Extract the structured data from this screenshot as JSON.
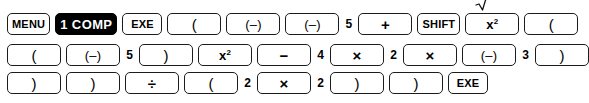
{
  "diagram": {
    "type": "key-sequence",
    "colors": {
      "background": "#ffffff",
      "key_outline": "#1c1c1c",
      "key_fill": "#ffffff",
      "key_text": "#000000",
      "inverted_fill": "#000000",
      "inverted_text": "#ffffff"
    },
    "rows": [
      {
        "index": 1,
        "items": [
          {
            "kind": "key",
            "name": "key-menu",
            "style": "label",
            "label": "MENU"
          },
          {
            "kind": "key",
            "name": "key-1-comp",
            "style": "inverted",
            "label": "1 COMP"
          },
          {
            "kind": "key",
            "name": "key-exe",
            "style": "label",
            "label": "EXE"
          },
          {
            "kind": "key",
            "name": "key-open-paren",
            "style": "paren",
            "label": "("
          },
          {
            "kind": "key",
            "name": "key-negative",
            "style": "neg",
            "label": "(–)"
          },
          {
            "kind": "key",
            "name": "key-negative",
            "style": "neg",
            "label": "(–)"
          },
          {
            "kind": "digit",
            "name": "digit-5",
            "style": "digit",
            "label": "5"
          },
          {
            "kind": "key",
            "name": "key-plus",
            "style": "op",
            "label": "+"
          },
          {
            "kind": "key",
            "name": "key-shift",
            "style": "label",
            "label": "SHIFT"
          },
          {
            "kind": "key",
            "name": "key-x-squared",
            "style": "sq",
            "label": "x²",
            "shift_mark": "sqrt-icon"
          },
          {
            "kind": "key",
            "name": "key-open-paren",
            "style": "paren",
            "label": "("
          }
        ]
      },
      {
        "index": 2,
        "items": [
          {
            "kind": "key",
            "name": "key-open-paren",
            "style": "paren",
            "label": "("
          },
          {
            "kind": "key",
            "name": "key-negative",
            "style": "neg",
            "label": "(–)"
          },
          {
            "kind": "digit",
            "name": "digit-5",
            "style": "digit",
            "label": "5"
          },
          {
            "kind": "key",
            "name": "key-close-paren",
            "style": "paren",
            "label": ")"
          },
          {
            "kind": "key",
            "name": "key-x-squared",
            "style": "sq",
            "label": "x²"
          },
          {
            "kind": "key",
            "name": "key-minus",
            "style": "op",
            "label": "−"
          },
          {
            "kind": "digit",
            "name": "digit-4",
            "style": "digit",
            "label": "4"
          },
          {
            "kind": "key",
            "name": "key-multiply",
            "style": "op",
            "label": "×"
          },
          {
            "kind": "digit",
            "name": "digit-2",
            "style": "digit",
            "label": "2"
          },
          {
            "kind": "key",
            "name": "key-multiply",
            "style": "op",
            "label": "×"
          },
          {
            "kind": "key",
            "name": "key-negative",
            "style": "neg",
            "label": "(–)"
          },
          {
            "kind": "digit",
            "name": "digit-3",
            "style": "digit",
            "label": "3"
          },
          {
            "kind": "key",
            "name": "key-close-paren",
            "style": "paren",
            "label": ")"
          }
        ]
      },
      {
        "index": 3,
        "items": [
          {
            "kind": "key",
            "name": "key-close-paren",
            "style": "paren",
            "label": ")"
          },
          {
            "kind": "key",
            "name": "key-close-paren",
            "style": "paren",
            "label": ")"
          },
          {
            "kind": "key",
            "name": "key-divide",
            "style": "op",
            "label": "÷"
          },
          {
            "kind": "key",
            "name": "key-open-paren",
            "style": "paren",
            "label": "("
          },
          {
            "kind": "digit",
            "name": "digit-2",
            "style": "digit",
            "label": "2"
          },
          {
            "kind": "key",
            "name": "key-multiply",
            "style": "op",
            "label": "×"
          },
          {
            "kind": "digit",
            "name": "digit-2",
            "style": "digit",
            "label": "2"
          },
          {
            "kind": "key",
            "name": "key-close-paren",
            "style": "paren",
            "label": ")"
          },
          {
            "kind": "key",
            "name": "key-close-paren",
            "style": "paren",
            "label": ")"
          },
          {
            "kind": "key",
            "name": "key-exe",
            "style": "label",
            "label": "EXE"
          }
        ]
      }
    ]
  }
}
